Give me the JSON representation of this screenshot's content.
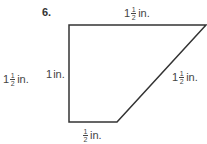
{
  "problem": {
    "number": "6.",
    "shape": "trapezoid",
    "stroke_color": "#333333",
    "vertices": [
      [
        69,
        25
      ],
      [
        207,
        25
      ],
      [
        117,
        122
      ],
      [
        69,
        122
      ]
    ]
  },
  "labels": {
    "top": {
      "whole": "1",
      "num": "1",
      "den": "2",
      "unit": "in."
    },
    "diagonal": {
      "whole": "1",
      "num": "1",
      "den": "2",
      "unit": "in."
    },
    "left_inner": {
      "whole": "1",
      "unit": "in."
    },
    "left_outer": {
      "whole": "1",
      "num": "1",
      "den": "2",
      "unit": "in."
    },
    "bottom": {
      "whole": "",
      "num": "1",
      "den": "2",
      "unit": "in."
    }
  }
}
